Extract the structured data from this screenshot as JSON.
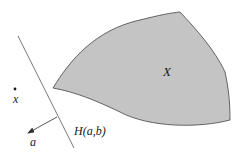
{
  "diagram": {
    "set_label": "X",
    "point_label": "x",
    "hyperplane_label": "H(a,b)",
    "normal_label": "a",
    "colors": {
      "set_fill": "#c4c4c4",
      "set_stroke": "#555555",
      "line": "#777777",
      "arrow": "#444444",
      "text": "#1a1a1a"
    },
    "elements": [
      {
        "id": "convex-set",
        "kind": "region",
        "label": "X"
      },
      {
        "id": "point",
        "kind": "point",
        "label": "x"
      },
      {
        "id": "hyperplane",
        "kind": "line",
        "label": "H(a,b)"
      },
      {
        "id": "normal-vector",
        "kind": "arrow",
        "label": "a",
        "direction": "outward from hyperplane toward point side"
      }
    ]
  }
}
